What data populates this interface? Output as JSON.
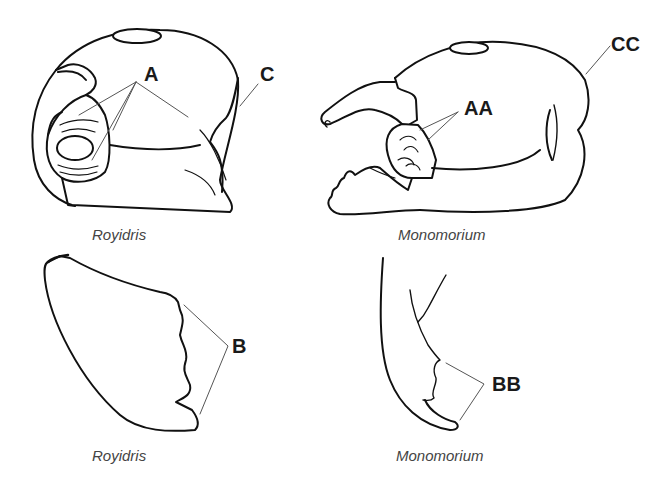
{
  "figure": {
    "panels": [
      {
        "id": "royidris-head",
        "caption": "Royidris",
        "labels": [
          "A",
          "C"
        ]
      },
      {
        "id": "monomorium-head",
        "caption": "Monomorium",
        "labels": [
          "AA",
          "CC"
        ]
      },
      {
        "id": "royidris-mandible",
        "caption": "Royidris",
        "labels": [
          "B"
        ]
      },
      {
        "id": "monomorium-mandible",
        "caption": "Monomorium",
        "labels": [
          "BB"
        ]
      }
    ],
    "labels": {
      "A": "A",
      "C": "C",
      "AA": "AA",
      "CC": "CC",
      "B": "B",
      "BB": "BB"
    },
    "captions": {
      "top_left": "Royidris",
      "top_right": "Monomorium",
      "bottom_left": "Royidris",
      "bottom_right": "Monomorium"
    },
    "colors": {
      "line": "#111111",
      "leader": "#555555",
      "caption": "#444444"
    }
  }
}
